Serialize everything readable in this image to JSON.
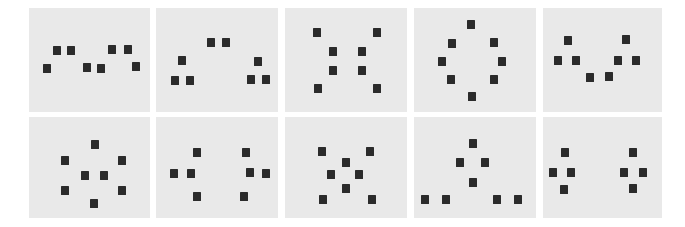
{
  "figure": {
    "kind": "dot-pattern-stimulus-grid",
    "width": 685,
    "height": 227,
    "rows": 2,
    "columns": 5,
    "page_background": "#ffffff",
    "panel_background": "#e9e9e9",
    "dot_color": "#2b2b2b",
    "dot_width": 8,
    "dot_height": 9,
    "panel_count": 10,
    "dots_per_panel": 8
  },
  "panels": [
    {
      "id": "panel-1",
      "row": 1,
      "column": 1,
      "label": "",
      "x": 29,
      "y": 8,
      "width": 121,
      "height": 104,
      "dots": [
        {
          "x": 24,
          "y": 38
        },
        {
          "x": 38,
          "y": 38
        },
        {
          "x": 79,
          "y": 37
        },
        {
          "x": 95,
          "y": 37
        },
        {
          "x": 14,
          "y": 56
        },
        {
          "x": 54,
          "y": 55
        },
        {
          "x": 68,
          "y": 56
        },
        {
          "x": 103,
          "y": 54
        }
      ]
    },
    {
      "id": "panel-2",
      "row": 1,
      "column": 2,
      "label": "",
      "x": 156,
      "y": 8,
      "width": 122,
      "height": 104,
      "dots": [
        {
          "x": 51,
          "y": 30
        },
        {
          "x": 66,
          "y": 30
        },
        {
          "x": 22,
          "y": 48
        },
        {
          "x": 98,
          "y": 49
        },
        {
          "x": 15,
          "y": 68
        },
        {
          "x": 30,
          "y": 68
        },
        {
          "x": 91,
          "y": 67
        },
        {
          "x": 106,
          "y": 67
        }
      ]
    },
    {
      "id": "panel-3",
      "row": 1,
      "column": 3,
      "label": "",
      "x": 285,
      "y": 8,
      "width": 122,
      "height": 104,
      "dots": [
        {
          "x": 28,
          "y": 20
        },
        {
          "x": 88,
          "y": 20
        },
        {
          "x": 44,
          "y": 39
        },
        {
          "x": 73,
          "y": 39
        },
        {
          "x": 44,
          "y": 58
        },
        {
          "x": 73,
          "y": 58
        },
        {
          "x": 29,
          "y": 76
        },
        {
          "x": 88,
          "y": 76
        }
      ]
    },
    {
      "id": "panel-4",
      "row": 1,
      "column": 4,
      "label": "",
      "x": 414,
      "y": 8,
      "width": 122,
      "height": 104,
      "dots": [
        {
          "x": 53,
          "y": 12
        },
        {
          "x": 34,
          "y": 31
        },
        {
          "x": 76,
          "y": 30
        },
        {
          "x": 24,
          "y": 49
        },
        {
          "x": 84,
          "y": 49
        },
        {
          "x": 33,
          "y": 67
        },
        {
          "x": 76,
          "y": 67
        },
        {
          "x": 54,
          "y": 84
        }
      ]
    },
    {
      "id": "panel-5",
      "row": 1,
      "column": 5,
      "label": "",
      "x": 543,
      "y": 8,
      "width": 119,
      "height": 104,
      "dots": [
        {
          "x": 21,
          "y": 28
        },
        {
          "x": 79,
          "y": 27
        },
        {
          "x": 11,
          "y": 48
        },
        {
          "x": 29,
          "y": 48
        },
        {
          "x": 71,
          "y": 48
        },
        {
          "x": 89,
          "y": 48
        },
        {
          "x": 43,
          "y": 65
        },
        {
          "x": 62,
          "y": 64
        }
      ]
    },
    {
      "id": "panel-6",
      "row": 2,
      "column": 1,
      "label": "",
      "x": 29,
      "y": 117,
      "width": 121,
      "height": 101,
      "dots": [
        {
          "x": 62,
          "y": 23
        },
        {
          "x": 32,
          "y": 39
        },
        {
          "x": 89,
          "y": 39
        },
        {
          "x": 52,
          "y": 54
        },
        {
          "x": 71,
          "y": 54
        },
        {
          "x": 32,
          "y": 69
        },
        {
          "x": 89,
          "y": 69
        },
        {
          "x": 61,
          "y": 82
        }
      ]
    },
    {
      "id": "panel-7",
      "row": 2,
      "column": 2,
      "label": "",
      "x": 156,
      "y": 117,
      "width": 122,
      "height": 101,
      "dots": [
        {
          "x": 37,
          "y": 31
        },
        {
          "x": 86,
          "y": 31
        },
        {
          "x": 14,
          "y": 52
        },
        {
          "x": 31,
          "y": 52
        },
        {
          "x": 90,
          "y": 51
        },
        {
          "x": 106,
          "y": 52
        },
        {
          "x": 37,
          "y": 75
        },
        {
          "x": 84,
          "y": 75
        }
      ]
    },
    {
      "id": "panel-8",
      "row": 2,
      "column": 3,
      "label": "",
      "x": 285,
      "y": 117,
      "width": 122,
      "height": 101,
      "dots": [
        {
          "x": 33,
          "y": 30
        },
        {
          "x": 81,
          "y": 30
        },
        {
          "x": 57,
          "y": 41
        },
        {
          "x": 42,
          "y": 53
        },
        {
          "x": 70,
          "y": 53
        },
        {
          "x": 57,
          "y": 67
        },
        {
          "x": 34,
          "y": 78
        },
        {
          "x": 83,
          "y": 78
        }
      ]
    },
    {
      "id": "panel-9",
      "row": 2,
      "column": 4,
      "label": "",
      "x": 414,
      "y": 117,
      "width": 122,
      "height": 101,
      "dots": [
        {
          "x": 55,
          "y": 22
        },
        {
          "x": 42,
          "y": 41
        },
        {
          "x": 67,
          "y": 41
        },
        {
          "x": 55,
          "y": 61
        },
        {
          "x": 7,
          "y": 78
        },
        {
          "x": 28,
          "y": 78
        },
        {
          "x": 79,
          "y": 78
        },
        {
          "x": 100,
          "y": 78
        }
      ]
    },
    {
      "id": "panel-10",
      "row": 2,
      "column": 5,
      "label": "",
      "x": 543,
      "y": 117,
      "width": 119,
      "height": 101,
      "dots": [
        {
          "x": 18,
          "y": 31
        },
        {
          "x": 86,
          "y": 31
        },
        {
          "x": 6,
          "y": 51
        },
        {
          "x": 24,
          "y": 51
        },
        {
          "x": 77,
          "y": 51
        },
        {
          "x": 96,
          "y": 51
        },
        {
          "x": 17,
          "y": 68
        },
        {
          "x": 86,
          "y": 67
        }
      ]
    }
  ]
}
